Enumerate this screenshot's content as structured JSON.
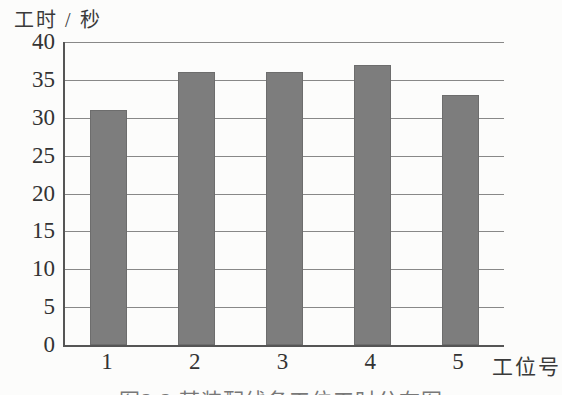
{
  "figure": {
    "y_axis_title": "工时 / 秒",
    "x_axis_title": "工位号",
    "caption_cropped": "图2-2 某装配线各工位工时分布图"
  },
  "chart_data": {
    "type": "bar",
    "categories": [
      "1",
      "2",
      "3",
      "4",
      "5"
    ],
    "values": [
      31,
      36,
      36,
      37,
      33
    ],
    "title": "",
    "xlabel": "工位号",
    "ylabel": "工时 / 秒",
    "ylim": [
      0,
      40
    ],
    "ytick_step": 5,
    "yticks": [
      40,
      35,
      30,
      25,
      20,
      15,
      10,
      5,
      0
    ],
    "grid": true,
    "legend": "none",
    "bar_color": "#7d7d7d",
    "bar_edge_color": "#6a6a6a",
    "grid_color": "#888888",
    "axis_color": "#555555",
    "background": "#fcfcfb"
  }
}
